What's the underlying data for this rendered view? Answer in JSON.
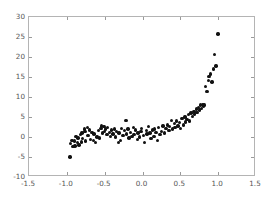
{
  "chart_data": {
    "type": "scatter",
    "title": "",
    "xlabel": "",
    "ylabel": "",
    "xlim": [
      -1.5,
      1.5
    ],
    "ylim": [
      -10,
      30
    ],
    "xticks": [
      -1.5,
      -1.0,
      -0.5,
      0.0,
      0.5,
      1.0,
      1.5
    ],
    "xticklabels": [
      "-1.5",
      "-1.0",
      "-0.5",
      "0.0",
      "0.5",
      "1.0",
      "1.5"
    ],
    "yticks": [
      -10,
      -5,
      0,
      5,
      10,
      15,
      20,
      25,
      30
    ],
    "yticklabels": [
      "-10",
      "-5",
      "0",
      "5",
      "10",
      "15",
      "20",
      "25",
      "30"
    ],
    "grid": false,
    "legend": null,
    "marker": "circle",
    "marker_color": "#111111",
    "marker_size": 3.4,
    "series": [
      {
        "name": "observations",
        "points": [
          [
            -0.96,
            -5.0
          ],
          [
            -0.95,
            -1.6
          ],
          [
            -0.93,
            -0.9
          ],
          [
            -0.92,
            -2.4
          ],
          [
            -0.9,
            -1.0
          ],
          [
            -0.89,
            -2.2
          ],
          [
            -0.88,
            0.2
          ],
          [
            -0.86,
            -1.4
          ],
          [
            -0.85,
            -0.2
          ],
          [
            -0.84,
            -2.0
          ],
          [
            -0.82,
            0.6
          ],
          [
            -0.81,
            -1.2
          ],
          [
            -0.8,
            1.0
          ],
          [
            -0.79,
            -0.4
          ],
          [
            -0.77,
            2.0
          ],
          [
            -0.76,
            1.4
          ],
          [
            -0.75,
            -1.0
          ],
          [
            -0.73,
            2.4
          ],
          [
            -0.72,
            0.4
          ],
          [
            -0.7,
            1.8
          ],
          [
            -0.69,
            -0.6
          ],
          [
            -0.67,
            1.2
          ],
          [
            -0.65,
            -0.8
          ],
          [
            -0.64,
            0.8
          ],
          [
            -0.62,
            -1.4
          ],
          [
            -0.6,
            0.0
          ],
          [
            -0.58,
            1.6
          ],
          [
            -0.57,
            -0.2
          ],
          [
            -0.55,
            2.2
          ],
          [
            -0.54,
            2.8
          ],
          [
            -0.53,
            1.0
          ],
          [
            -0.51,
            2.6
          ],
          [
            -0.5,
            1.4
          ],
          [
            -0.49,
            2.0
          ],
          [
            -0.47,
            0.6
          ],
          [
            -0.46,
            2.4
          ],
          [
            -0.44,
            1.2
          ],
          [
            -0.42,
            0.2
          ],
          [
            -0.41,
            1.8
          ],
          [
            -0.39,
            0.8
          ],
          [
            -0.37,
            2.0
          ],
          [
            -0.36,
            0.0
          ],
          [
            -0.34,
            1.4
          ],
          [
            -0.32,
            -1.4
          ],
          [
            -0.31,
            1.0
          ],
          [
            -0.29,
            -0.8
          ],
          [
            -0.28,
            2.2
          ],
          [
            -0.26,
            0.4
          ],
          [
            -0.24,
            1.6
          ],
          [
            -0.22,
            4.2
          ],
          [
            -0.21,
            0.8
          ],
          [
            -0.19,
            2.0
          ],
          [
            -0.18,
            -0.2
          ],
          [
            -0.16,
            1.2
          ],
          [
            -0.14,
            0.2
          ],
          [
            -0.12,
            2.4
          ],
          [
            -0.11,
            0.6
          ],
          [
            -0.09,
            1.8
          ],
          [
            -0.07,
            -0.6
          ],
          [
            -0.06,
            1.0
          ],
          [
            -0.04,
            0.0
          ],
          [
            -0.02,
            1.4
          ],
          [
            -0.01,
            2.2
          ],
          [
            0.01,
            0.4
          ],
          [
            0.03,
            -1.4
          ],
          [
            0.05,
            1.6
          ],
          [
            0.06,
            0.8
          ],
          [
            0.08,
            2.6
          ],
          [
            0.1,
            1.0
          ],
          [
            0.11,
            -0.4
          ],
          [
            0.13,
            1.8
          ],
          [
            0.15,
            0.2
          ],
          [
            0.16,
            2.0
          ],
          [
            0.18,
            1.2
          ],
          [
            0.2,
            -0.8
          ],
          [
            0.21,
            2.4
          ],
          [
            0.23,
            0.6
          ],
          [
            0.25,
            1.4
          ],
          [
            0.27,
            2.8
          ],
          [
            0.29,
            1.0
          ],
          [
            0.31,
            2.2
          ],
          [
            0.33,
            3.0
          ],
          [
            0.35,
            1.6
          ],
          [
            0.36,
            2.6
          ],
          [
            0.38,
            4.2
          ],
          [
            0.4,
            2.0
          ],
          [
            0.42,
            3.4
          ],
          [
            0.43,
            2.4
          ],
          [
            0.45,
            4.0
          ],
          [
            0.47,
            2.8
          ],
          [
            0.49,
            3.6
          ],
          [
            0.5,
            2.2
          ],
          [
            0.52,
            4.6
          ],
          [
            0.54,
            3.0
          ],
          [
            0.56,
            5.0
          ],
          [
            0.57,
            3.8
          ],
          [
            0.59,
            4.4
          ],
          [
            0.61,
            5.6
          ],
          [
            0.62,
            4.0
          ],
          [
            0.64,
            6.0
          ],
          [
            0.66,
            5.2
          ],
          [
            0.68,
            6.4
          ],
          [
            0.69,
            5.8
          ],
          [
            0.71,
            7.0
          ],
          [
            0.72,
            6.2
          ],
          [
            0.74,
            7.4
          ],
          [
            0.75,
            6.8
          ],
          [
            0.77,
            8.0
          ],
          [
            0.78,
            7.2
          ],
          [
            0.8,
            8.2
          ],
          [
            0.81,
            7.8
          ],
          [
            0.82,
            8.0
          ],
          [
            0.83,
            12.6
          ],
          [
            0.85,
            11.4
          ],
          [
            0.87,
            14.2
          ],
          [
            0.88,
            15.2
          ],
          [
            0.9,
            15.8
          ],
          [
            0.92,
            13.8
          ],
          [
            0.94,
            17.0
          ],
          [
            0.95,
            20.6
          ],
          [
            0.97,
            17.8
          ],
          [
            1.0,
            25.8
          ]
        ]
      }
    ]
  }
}
